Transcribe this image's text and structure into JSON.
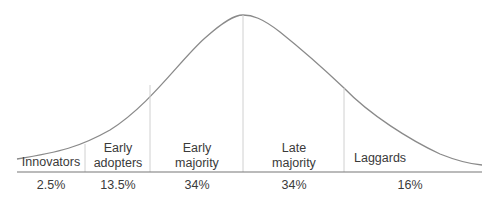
{
  "diagram": {
    "type": "bell-curve",
    "segments": [
      {
        "label": "Innovators",
        "percent": "2.5%"
      },
      {
        "label": "Early adopters",
        "label_lines": [
          "Early",
          "adopters"
        ],
        "percent": "13.5%"
      },
      {
        "label": "Early majority",
        "label_lines": [
          "Early",
          "majority"
        ],
        "percent": "34%"
      },
      {
        "label": "Late majority",
        "label_lines": [
          "Late",
          "majority"
        ],
        "percent": "34%"
      },
      {
        "label": "Laggards",
        "percent": "16%"
      }
    ],
    "colors": {
      "curve": "#888888",
      "divider": "#d0d0d0",
      "baseline": "#777777",
      "text": "#3a3a3a"
    }
  }
}
